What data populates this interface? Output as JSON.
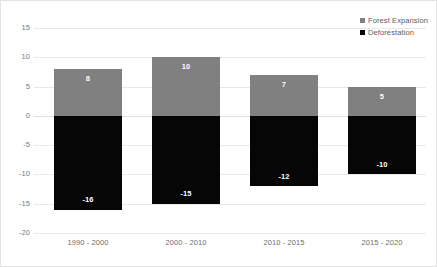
{
  "chart_data": {
    "type": "bar",
    "title": "",
    "xlabel": "",
    "ylabel": "",
    "ylim": [
      -20,
      15
    ],
    "yticks": [
      15,
      10,
      5,
      0,
      -5,
      -10,
      -15,
      -20
    ],
    "ytick_labels": [
      "15",
      "10",
      "5",
      "0",
      "-5",
      "-10",
      "-15",
      "-20"
    ],
    "grid": true,
    "legend_position": "top-right",
    "categories": [
      "1990 - 2000",
      "2000 - 2010",
      "2010 - 2015",
      "2015 - 2020"
    ],
    "series": [
      {
        "name": "Forest Expansion",
        "color": "#808080",
        "values": [
          8,
          10,
          7,
          5
        ],
        "value_labels": [
          "8",
          "10",
          "7",
          "5"
        ]
      },
      {
        "name": "Deforestation",
        "color": "#060606",
        "values": [
          -16,
          -15,
          -12,
          -10
        ],
        "value_labels": [
          "-16",
          "-15",
          "-12",
          "-10"
        ]
      }
    ]
  },
  "legend": {
    "items": [
      {
        "label": "Forest Expansion",
        "marker": "square-marker-gray"
      },
      {
        "label": "Deforestation",
        "marker": "square-marker-black"
      }
    ]
  }
}
